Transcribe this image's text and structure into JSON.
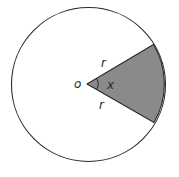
{
  "diagram": {
    "colors": {
      "background": "#ffffff",
      "stroke": "#2a2a2a",
      "sector_fill": "#8a8a8a"
    },
    "labels": {
      "center": "o",
      "radius_upper": "r",
      "radius_lower": "r",
      "angle": "x"
    }
  }
}
